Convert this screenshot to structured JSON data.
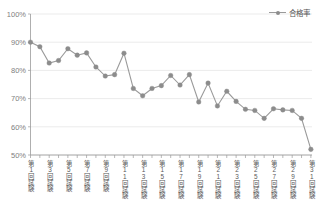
{
  "chart_data": {
    "type": "line",
    "title": "",
    "xlabel": "",
    "ylabel": "",
    "ylim": [
      50,
      100
    ],
    "ytick_values": [
      50,
      60,
      70,
      80,
      90,
      100
    ],
    "ytick_labels": [
      "50%",
      "60%",
      "70%",
      "80%",
      "90%",
      "100%"
    ],
    "grid": true,
    "legend_position": "top-right",
    "legend": [
      "合格率"
    ],
    "series": [
      {
        "name": "合格率",
        "color": "#8c8c8c",
        "marker": "circle",
        "values": [
          90.0,
          88.4,
          82.6,
          83.5,
          87.7,
          85.4,
          86.2,
          81.2,
          78.0,
          78.5,
          86.1,
          73.6,
          71.0,
          73.6,
          74.6,
          78.2,
          74.8,
          78.5,
          68.8,
          75.5,
          67.4,
          72.6,
          69.0,
          66.2,
          65.8,
          63.0,
          66.4,
          66.0,
          65.8,
          63.0,
          52.0
        ]
      }
    ],
    "x": [
      1,
      2,
      3,
      4,
      5,
      6,
      7,
      8,
      9,
      10,
      11,
      12,
      13,
      14,
      15,
      16,
      17,
      18,
      19,
      20,
      21,
      22,
      23,
      24,
      25,
      26,
      27,
      28,
      29,
      30,
      31
    ],
    "xtick_positions": [
      1,
      3,
      5,
      7,
      9,
      11,
      13,
      15,
      17,
      19,
      21,
      23,
      25,
      27,
      29,
      31
    ],
    "xtick_labels": [
      "第1回試験",
      "第3回試験",
      "第5回試験",
      "第7回試験",
      "第9回試験",
      "第11回試験",
      "第13回試験",
      "第15回試験",
      "第17回試験",
      "第19回試験",
      "第21回試験",
      "第23回試験",
      "第25回試験",
      "第27回試験",
      "第29回試験",
      "第31回試験"
    ]
  },
  "colors": {
    "series": "#8c8c8c",
    "grid": "#e2e2e2",
    "axis": "#9a9a9a",
    "tick_text": "#808080",
    "label_text": "#5a5a5a",
    "background": "#ffffff"
  }
}
